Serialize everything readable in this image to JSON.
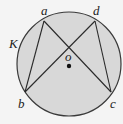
{
  "diagram": {
    "type": "geometry",
    "background": "#f4f4f4",
    "circle": {
      "label": "K",
      "cx": 69,
      "cy": 64,
      "r": 52,
      "fill": "#d8d8d8",
      "stroke": "#3a3a3a"
    },
    "center": {
      "label": "o",
      "x": 69,
      "y": 66
    },
    "points": [
      {
        "label": "a",
        "x": 44,
        "y": 21,
        "label_x": 41,
        "label_y": 14
      },
      {
        "label": "d",
        "x": 95,
        "y": 21,
        "label_x": 94,
        "label_y": 14
      },
      {
        "label": "b",
        "x": 25,
        "y": 92,
        "label_x": 18,
        "label_y": 107
      },
      {
        "label": "c",
        "x": 111,
        "y": 92,
        "label_x": 111,
        "label_y": 107
      }
    ],
    "chords": [
      {
        "from": "a",
        "to": "b"
      },
      {
        "from": "a",
        "to": "c"
      },
      {
        "from": "d",
        "to": "b"
      },
      {
        "from": "d",
        "to": "c"
      }
    ],
    "labels": {
      "circle_label": "K",
      "center_label": "o",
      "point_a": "a",
      "point_b": "b",
      "point_c": "c",
      "point_d": "d"
    }
  }
}
